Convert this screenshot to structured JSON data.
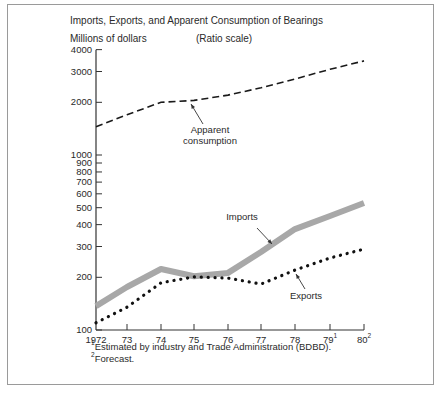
{
  "chart_data": {
    "type": "line",
    "title": "Imports, Exports, and Apparent Consumption of Bearings",
    "ylabel": "Millions of dollars",
    "scale_note": "(Ratio scale)",
    "yscale": "log",
    "ylim": [
      100,
      4000
    ],
    "yticks": [
      100,
      200,
      300,
      400,
      500,
      600,
      700,
      800,
      900,
      1000,
      2000,
      3000,
      4000
    ],
    "ytick_labels": [
      "100",
      "200",
      "300",
      "400",
      "500",
      "600",
      "700",
      "800",
      "900",
      "1000",
      "2000",
      "3000",
      "4000"
    ],
    "x": [
      "1972",
      "73",
      "74",
      "75",
      "76",
      "77",
      "78",
      "79",
      "80"
    ],
    "x_labels": [
      {
        "text": "1972",
        "sup": ""
      },
      {
        "text": "73",
        "sup": ""
      },
      {
        "text": "74",
        "sup": ""
      },
      {
        "text": "75",
        "sup": ""
      },
      {
        "text": "76",
        "sup": ""
      },
      {
        "text": "77",
        "sup": ""
      },
      {
        "text": "78",
        "sup": ""
      },
      {
        "text": "79",
        "sup": "1"
      },
      {
        "text": "80",
        "sup": "2"
      }
    ],
    "series": [
      {
        "name": "Apparent consumption",
        "style": "dashed",
        "color": "#1a1a1a",
        "values": [
          1450,
          1700,
          2000,
          2050,
          2200,
          2420,
          2720,
          3090,
          3450
        ]
      },
      {
        "name": "Imports",
        "style": "thick-gray",
        "color": "#a8a8a8",
        "values": [
          137,
          176,
          223,
          203,
          212,
          279,
          377,
          448,
          532
        ]
      },
      {
        "name": "Exports",
        "style": "dotted",
        "color": "#111111",
        "values": [
          110,
          135,
          186,
          201,
          198,
          183,
          220,
          258,
          290
        ]
      }
    ],
    "annotations": [
      {
        "text": "Apparent",
        "text2": "consumption",
        "target_series": "Apparent consumption"
      },
      {
        "text": "Imports",
        "target_series": "Imports"
      },
      {
        "text": "Exports",
        "target_series": "Exports"
      }
    ],
    "footnotes": [
      {
        "mark": "1",
        "text": "Estimated by industry and Trade Administration (BDBD)."
      },
      {
        "mark": "2",
        "text": "Forecast."
      }
    ],
    "grid": false,
    "legend": "inline labels with arrows"
  }
}
